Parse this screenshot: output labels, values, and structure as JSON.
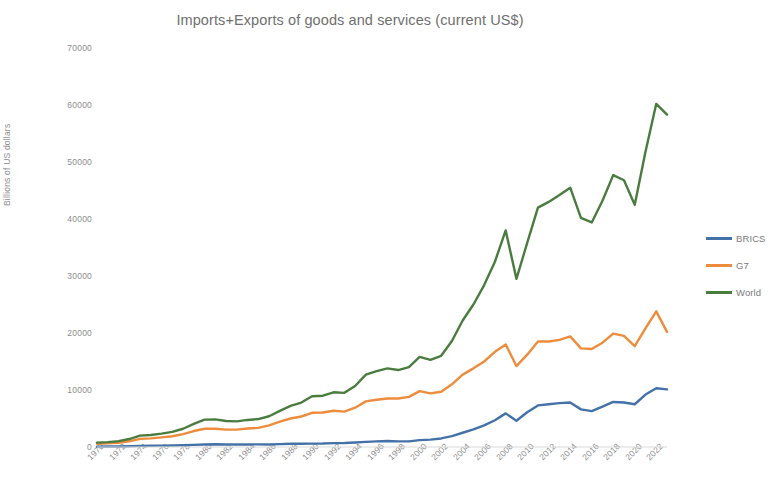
{
  "chart_data": {
    "type": "line",
    "title": "Imports+Exports of goods and services (current US$)",
    "xlabel": "",
    "ylabel": "Billions of US dollars",
    "ylim": [
      0,
      70000
    ],
    "y_ticks": [
      0,
      10000,
      20000,
      30000,
      40000,
      50000,
      60000,
      70000
    ],
    "y_tick_labels": [
      "0",
      "10000",
      "20000",
      "30000",
      "40000",
      "50000",
      "60000",
      "70000"
    ],
    "grid": false,
    "legend_position": "right",
    "x": [
      1970,
      1971,
      1972,
      1973,
      1974,
      1975,
      1976,
      1977,
      1978,
      1979,
      1980,
      1981,
      1982,
      1983,
      1984,
      1985,
      1986,
      1987,
      1988,
      1989,
      1990,
      1991,
      1992,
      1993,
      1994,
      1995,
      1996,
      1997,
      1998,
      1999,
      2000,
      2001,
      2002,
      2003,
      2004,
      2005,
      2006,
      2007,
      2008,
      2009,
      2010,
      2011,
      2012,
      2013,
      2014,
      2015,
      2016,
      2017,
      2018,
      2019,
      2020,
      2021,
      2022,
      2023
    ],
    "x_tick_labels": [
      "1970",
      "1972",
      "1974",
      "1976",
      "1978",
      "1980",
      "1982",
      "1984",
      "1986",
      "1988",
      "1990",
      "1992",
      "1994",
      "1996",
      "1998",
      "2000",
      "2002",
      "2004",
      "2006",
      "2008",
      "2010",
      "2012",
      "2014",
      "2016",
      "2018",
      "2020",
      "2022"
    ],
    "series": [
      {
        "name": "BRICS",
        "color": "#4472a8",
        "values": [
          70,
          80,
          95,
          140,
          200,
          215,
          235,
          260,
          300,
          380,
          450,
          470,
          450,
          440,
          450,
          460,
          450,
          500,
          560,
          580,
          600,
          610,
          680,
          700,
          780,
          900,
          980,
          1060,
          980,
          980,
          1200,
          1300,
          1500,
          1900,
          2500,
          3100,
          3800,
          4700,
          5900,
          4600,
          6100,
          7300,
          7500,
          7700,
          7800,
          6600,
          6300,
          7100,
          7900,
          7800,
          7500,
          9200,
          10300,
          10100
        ]
      },
      {
        "name": "G7",
        "color": "#ed8c3c",
        "values": [
          580,
          640,
          740,
          1000,
          1420,
          1520,
          1680,
          1880,
          2250,
          2800,
          3200,
          3200,
          3050,
          3050,
          3250,
          3350,
          3800,
          4450,
          5000,
          5350,
          6000,
          6050,
          6350,
          6200,
          6900,
          8000,
          8300,
          8500,
          8500,
          8800,
          9800,
          9400,
          9700,
          11000,
          12700,
          13800,
          15000,
          16700,
          18000,
          14200,
          16200,
          18500,
          18500,
          18800,
          19400,
          17300,
          17200,
          18300,
          19900,
          19500,
          17700,
          20800,
          23800,
          20200
        ]
      },
      {
        "name": "World",
        "color": "#4a7c3f",
        "values": [
          770,
          860,
          1020,
          1400,
          2000,
          2100,
          2350,
          2650,
          3200,
          4050,
          4800,
          4850,
          4550,
          4500,
          4750,
          4900,
          5400,
          6350,
          7200,
          7800,
          8900,
          9000,
          9600,
          9500,
          10700,
          12700,
          13300,
          13800,
          13500,
          14000,
          15800,
          15300,
          16000,
          18600,
          22200,
          25000,
          28400,
          32500,
          38000,
          29500,
          35800,
          42000,
          43000,
          44200,
          45500,
          40200,
          39400,
          43200,
          47700,
          46800,
          42500,
          51800,
          60200,
          58300
        ]
      }
    ]
  },
  "legend": {
    "items": [
      {
        "label": "BRICS",
        "color": "#4472a8"
      },
      {
        "label": "G7",
        "color": "#ed8c3c"
      },
      {
        "label": "World",
        "color": "#4a7c3f"
      }
    ]
  }
}
